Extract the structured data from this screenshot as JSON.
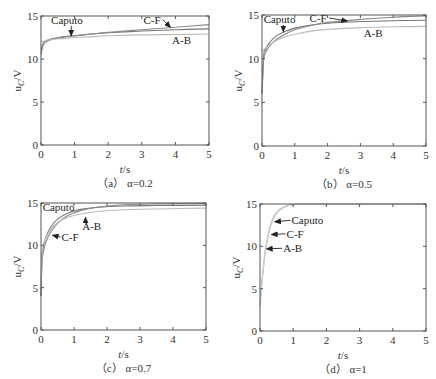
{
  "figure": {
    "width": 436,
    "height": 379,
    "colors": {
      "axis": "#555555",
      "curve_dark": "#777777",
      "curve_mid": "#8a8a8a",
      "curve_light": "#bbbbbb",
      "text": "#333333"
    }
  },
  "chart_data": [
    {
      "type": "line",
      "id": "a",
      "caption": "（a） α=0.2",
      "xlabel": "t/s",
      "ylabel": "u_C/V",
      "xlim": [
        0,
        5
      ],
      "ylim": [
        0,
        15
      ],
      "xticks": [
        0,
        1,
        2,
        3,
        4,
        5
      ],
      "yticks": [
        0,
        5,
        10,
        15
      ],
      "grid": false,
      "frame": {
        "x0": 41,
        "x1": 209,
        "ytop": 16,
        "ybot": 145
      },
      "series": [
        {
          "name": "Caputo",
          "color": "#777777",
          "x": [
            0,
            0.05,
            0.1,
            0.2,
            0.4,
            0.7,
            1,
            1.5,
            2,
            3,
            4,
            5
          ],
          "y": [
            11.0,
            11.7,
            12.0,
            12.2,
            12.4,
            12.6,
            12.7,
            12.9,
            13.05,
            13.25,
            13.4,
            13.5
          ]
        },
        {
          "name": "C-F",
          "color": "#8a8a8a",
          "x": [
            0,
            0.05,
            0.1,
            0.2,
            0.4,
            0.7,
            1,
            1.5,
            2,
            3,
            4,
            5
          ],
          "y": [
            10.5,
            11.4,
            11.8,
            12.1,
            12.35,
            12.55,
            12.7,
            12.9,
            13.1,
            13.4,
            13.7,
            14.0
          ]
        },
        {
          "name": "A-B",
          "color": "#bbbbbb",
          "x": [
            0,
            0.05,
            0.1,
            0.2,
            0.4,
            0.7,
            1,
            1.5,
            2,
            3,
            4,
            5
          ],
          "y": [
            12.0,
            12.05,
            12.1,
            12.2,
            12.3,
            12.4,
            12.5,
            12.6,
            12.7,
            12.8,
            12.85,
            12.9
          ]
        }
      ],
      "annotations": [
        {
          "text": "Caputo",
          "x": 0.3,
          "y": 14.1,
          "arrow_to": [
            0.9,
            12.7
          ]
        },
        {
          "text": "C-F",
          "x": 3.05,
          "y": 14.1,
          "arrow_to": [
            3.85,
            13.7
          ]
        },
        {
          "text": "A-B",
          "x": 3.9,
          "y": 11.8,
          "arrow_to": null
        }
      ]
    },
    {
      "type": "line",
      "id": "b",
      "caption": "（b） α=0.5",
      "xlabel": "t/s",
      "ylabel": "u_C/V",
      "xlim": [
        0,
        5
      ],
      "ylim": [
        0,
        15
      ],
      "xticks": [
        0,
        1,
        2,
        3,
        4,
        5
      ],
      "yticks": [
        0,
        5,
        10,
        15
      ],
      "grid": false,
      "frame": {
        "x0": 262,
        "x1": 426,
        "ytop": 15,
        "ybot": 146
      },
      "series": [
        {
          "name": "Caputo",
          "color": "#777777",
          "x": [
            0,
            0.05,
            0.1,
            0.2,
            0.4,
            0.7,
            1,
            1.5,
            2,
            3,
            4,
            5
          ],
          "y": [
            6,
            10.3,
            11.0,
            11.7,
            12.5,
            13.1,
            13.5,
            13.85,
            14.05,
            14.25,
            14.35,
            14.4
          ]
        },
        {
          "name": "C-F",
          "color": "#8a8a8a",
          "x": [
            0,
            0.05,
            0.1,
            0.2,
            0.4,
            0.7,
            1,
            1.5,
            2,
            3,
            4,
            5
          ],
          "y": [
            6,
            9.8,
            10.6,
            11.3,
            12.1,
            12.8,
            13.3,
            13.8,
            14.15,
            14.5,
            14.75,
            14.9
          ]
        },
        {
          "name": "A-B",
          "color": "#bbbbbb",
          "x": [
            0,
            0.05,
            0.1,
            0.2,
            0.4,
            0.7,
            1,
            1.5,
            2,
            3,
            4,
            5
          ],
          "y": [
            10.8,
            11.0,
            11.2,
            11.5,
            12.0,
            12.5,
            12.8,
            13.15,
            13.35,
            13.55,
            13.65,
            13.7
          ]
        }
      ],
      "annotations": [
        {
          "text": "Caputo",
          "x": 0.05,
          "y": 14.1,
          "arrow_to": [
            0.65,
            13.1
          ]
        },
        {
          "text": "C-F",
          "x": 1.45,
          "y": 14.2,
          "arrow_to": [
            2.6,
            14.3
          ]
        },
        {
          "text": "A-B",
          "x": 3.1,
          "y": 12.5,
          "arrow_to": null
        }
      ]
    },
    {
      "type": "line",
      "id": "c",
      "caption": "（c） α=0.7",
      "xlabel": "t/s",
      "ylabel": "u_C/V",
      "xlim": [
        0,
        5
      ],
      "ylim": [
        0,
        15
      ],
      "xticks": [
        0,
        1,
        2,
        3,
        4,
        5
      ],
      "yticks": [
        0,
        5,
        10,
        15
      ],
      "grid": false,
      "frame": {
        "x0": 41,
        "x1": 206,
        "ytop": 203,
        "ybot": 330
      },
      "series": [
        {
          "name": "Caputo",
          "color": "#777777",
          "x": [
            0,
            0.03,
            0.07,
            0.15,
            0.3,
            0.5,
            0.8,
            1.2,
            1.7,
            2.5,
            3.5,
            5
          ],
          "y": [
            4,
            8.5,
            9.8,
            11.0,
            12.2,
            13.1,
            13.8,
            14.25,
            14.5,
            14.65,
            14.7,
            14.75
          ]
        },
        {
          "name": "C-F",
          "color": "#8a8a8a",
          "x": [
            0,
            0.03,
            0.07,
            0.15,
            0.3,
            0.5,
            0.8,
            1.2,
            1.7,
            2.5,
            3.5,
            5
          ],
          "y": [
            4,
            8.0,
            9.2,
            10.4,
            11.6,
            12.6,
            13.5,
            14.1,
            14.5,
            14.8,
            14.9,
            14.95
          ]
        },
        {
          "name": "A-B",
          "color": "#bbbbbb",
          "x": [
            0,
            0.03,
            0.07,
            0.15,
            0.3,
            0.5,
            0.8,
            1.2,
            1.7,
            2.5,
            3.5,
            5
          ],
          "y": [
            6,
            9.0,
            10.0,
            10.9,
            11.9,
            12.7,
            13.3,
            13.7,
            14.0,
            14.2,
            14.3,
            14.4
          ]
        }
      ],
      "annotations": [
        {
          "text": "Caputo",
          "x": 0.05,
          "y": 14.0,
          "arrow_to": null
        },
        {
          "text": "C-F",
          "x": 0.62,
          "y": 10.5,
          "arrow_to": [
            0.35,
            11.2
          ]
        },
        {
          "text": "A-B",
          "x": 1.25,
          "y": 11.8,
          "arrow_to": [
            1.35,
            13.3
          ]
        }
      ]
    },
    {
      "type": "line",
      "id": "d",
      "caption": "（d） α=1",
      "xlabel": "t/s",
      "ylabel": "u_C/V",
      "xlim": [
        0,
        5
      ],
      "ylim": [
        0,
        15
      ],
      "xticks": [
        0,
        1,
        2,
        3,
        4,
        5
      ],
      "yticks": [
        0,
        5,
        10,
        15
      ],
      "grid": false,
      "frame": {
        "x0": 260,
        "x1": 426,
        "ytop": 204,
        "ybot": 331
      },
      "series": [
        {
          "name": "Caputo",
          "color": "#bbbbbb",
          "x": [
            0,
            0.05,
            0.1,
            0.15,
            0.2,
            0.3,
            0.4,
            0.5,
            0.6,
            0.8,
            1,
            1.5,
            5
          ],
          "y": [
            3,
            5.5,
            7.5,
            9.2,
            10.5,
            12.3,
            13.4,
            14.0,
            14.4,
            14.8,
            14.93,
            15,
            15
          ]
        },
        {
          "name": "C-F",
          "color": "#c4c4c4",
          "x": [
            0,
            0.05,
            0.1,
            0.15,
            0.2,
            0.3,
            0.4,
            0.5,
            0.6,
            0.8,
            1,
            1.5,
            5
          ],
          "y": [
            3,
            5.4,
            7.4,
            9.1,
            10.4,
            12.2,
            13.3,
            13.95,
            14.35,
            14.78,
            14.92,
            15,
            15
          ]
        },
        {
          "name": "A-B",
          "color": "#cccccc",
          "x": [
            0,
            0.05,
            0.1,
            0.15,
            0.2,
            0.3,
            0.4,
            0.5,
            0.6,
            0.8,
            1,
            1.5,
            5
          ],
          "y": [
            3,
            5.3,
            7.3,
            9.0,
            10.3,
            12.1,
            13.2,
            13.9,
            14.3,
            14.75,
            14.9,
            15,
            15
          ]
        }
      ],
      "annotations": [
        {
          "text": "Caputo",
          "x": 0.95,
          "y": 12.6,
          "arrow_to": [
            0.45,
            12.9
          ]
        },
        {
          "text": "C-F",
          "x": 0.8,
          "y": 11.0,
          "arrow_to": [
            0.35,
            11.4
          ]
        },
        {
          "text": "A-B",
          "x": 0.7,
          "y": 9.3,
          "arrow_to": [
            0.2,
            9.7
          ]
        }
      ]
    }
  ]
}
